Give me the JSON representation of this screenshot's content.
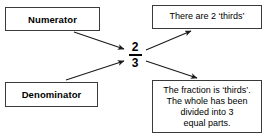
{
  "diagram": {
    "center_fraction": {
      "numerator": "2",
      "denominator": "3"
    },
    "boxes": {
      "numerator_label": "Numerator",
      "denominator_label": "Denominator",
      "there_are_2_thirds": "There are 2 ‘thirds’",
      "fraction_explanation_lines": [
        "The fraction is ‘thirds’.",
        "The whole has been",
        "divided into 3",
        "equal parts."
      ]
    },
    "arrows": [
      {
        "name": "numerator-to-fraction",
        "from": "Numerator",
        "to": "2 (numerator digit)"
      },
      {
        "name": "fraction-to-there-are-2-thirds",
        "from": "2 (numerator digit)",
        "to": "There are 2 ‘thirds’"
      },
      {
        "name": "denominator-to-fraction",
        "from": "Denominator",
        "to": "3 (denominator digit)"
      },
      {
        "name": "fraction-to-explanation",
        "from": "3 (denominator digit)",
        "to": "The fraction is ‘thirds’."
      }
    ],
    "colors": {
      "border": "#3a3a3a",
      "text": "#000000",
      "background": "#ffffff",
      "arrow": "#1a1a1a"
    }
  }
}
